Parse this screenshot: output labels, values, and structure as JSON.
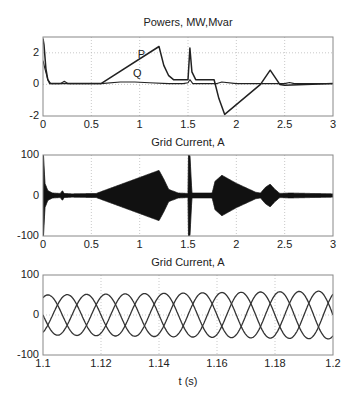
{
  "chart_data": [
    {
      "type": "line",
      "title": "Powers, MW,Mvar",
      "xlabel": "",
      "ylabel": "",
      "xlim": [
        0,
        3
      ],
      "ylim": [
        -2,
        3
      ],
      "xticks": [
        "0",
        "0.5",
        "1",
        "1.5",
        "2",
        "2.5",
        "3"
      ],
      "yticks": [
        "-2",
        "0",
        "2"
      ],
      "grid": true,
      "annotations": [
        {
          "text": "P",
          "x": 0.98,
          "y": 1.65
        },
        {
          "text": "Q",
          "x": 0.93,
          "y": 0.45
        }
      ],
      "series": [
        {
          "name": "P",
          "x": [
            0,
            0.01,
            0.03,
            0.05,
            0.07,
            0.1,
            0.2,
            0.25,
            0.3,
            0.6,
            1.2,
            1.25,
            1.3,
            1.35,
            1.5,
            1.52,
            1.54,
            1.58,
            1.77,
            1.82,
            1.88,
            2.25,
            2.35,
            2.45,
            2.5,
            3.0
          ],
          "y": [
            2.9,
            2.5,
            1.0,
            0.3,
            0.05,
            0.05,
            0.05,
            0.05,
            0.05,
            0.05,
            2.4,
            1.2,
            0.55,
            0.3,
            0.3,
            2.3,
            0.8,
            0.3,
            0.3,
            -0.9,
            -1.9,
            0.0,
            0.9,
            0.0,
            -0.05,
            0.05
          ]
        },
        {
          "name": "Q",
          "x": [
            0,
            0.02,
            0.05,
            0.08,
            0.18,
            0.22,
            0.26,
            0.3,
            0.6,
            0.8,
            0.95,
            1.1,
            1.3,
            1.45,
            1.5,
            1.52,
            1.55,
            1.8,
            1.85,
            2.0,
            2.5,
            2.55,
            2.6,
            3.0
          ],
          "y": [
            1.5,
            1.0,
            0.3,
            0.05,
            0.05,
            0.2,
            0.05,
            0.05,
            0.05,
            0.15,
            0.15,
            0.1,
            0.05,
            0.05,
            0.1,
            0.3,
            0.05,
            0.05,
            0.15,
            0.05,
            0.05,
            0.12,
            0.05,
            0.05
          ]
        }
      ]
    },
    {
      "type": "area",
      "title": "Grid Current, A",
      "xlabel": "",
      "ylabel": "",
      "xlim": [
        0,
        3
      ],
      "ylim": [
        -100,
        100
      ],
      "xticks": [
        "0",
        "0.5",
        "1",
        "1.5",
        "2",
        "2.5",
        "3"
      ],
      "yticks": [
        "-100",
        "0",
        "100"
      ],
      "grid": true,
      "envelope": {
        "description": "amplitude envelope of three-phase grid current (filled oscillation)",
        "x": [
          0,
          0.005,
          0.02,
          0.05,
          0.1,
          0.18,
          0.2,
          0.22,
          0.3,
          0.55,
          1.2,
          1.25,
          1.3,
          1.4,
          1.5,
          1.505,
          1.52,
          1.54,
          1.75,
          1.78,
          1.85,
          2.0,
          2.2,
          2.25,
          2.3,
          2.35,
          2.4,
          2.45,
          2.55,
          3.0
        ],
        "amplitude": [
          100,
          100,
          30,
          12,
          6,
          5,
          12,
          5,
          4,
          5,
          62,
          40,
          15,
          6,
          5,
          100,
          100,
          6,
          6,
          35,
          50,
          30,
          8,
          6,
          20,
          28,
          15,
          5,
          6,
          4
        ]
      }
    },
    {
      "type": "line",
      "title": "Grid Current, A",
      "xlabel": "t (s)",
      "ylabel": "",
      "xlim": [
        1.1,
        1.2
      ],
      "ylim": [
        -100,
        100
      ],
      "xticks": [
        "1.1",
        "1.12",
        "1.14",
        "1.16",
        "1.18",
        "1.2"
      ],
      "yticks": [
        "-100",
        "0",
        "100"
      ],
      "grid": true,
      "frequency_hz": 50,
      "amplitude_start": 50,
      "amplitude_end": 60,
      "series": [
        {
          "name": "Phase A",
          "phase_deg": 0
        },
        {
          "name": "Phase B",
          "phase_deg": -120
        },
        {
          "name": "Phase C",
          "phase_deg": 120
        }
      ]
    }
  ],
  "labels": {
    "plot1_title": "Powers, MW,Mvar",
    "plot2_title": "Grid Current, A",
    "plot3_title": "Grid Current, A",
    "plot3_xlabel": "t (s)",
    "annot_P": "P",
    "annot_Q": "Q"
  }
}
